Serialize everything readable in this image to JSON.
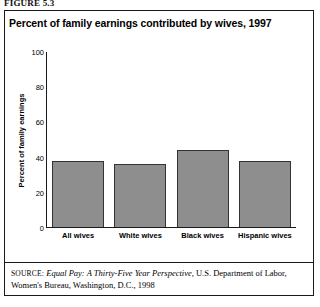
{
  "figure": {
    "label": "FIGURE 5.3",
    "title": "Percent of family earnings contributed by wives, 1997"
  },
  "source": {
    "prefix": "SOURCE:",
    "publication": "Equal Pay: A Thirty-Five Year Perspective,",
    "rest": "U.S. Department of Labor, Women's Bureau, Washington, D.C., 1998"
  },
  "colors": {
    "bar_fill": "#8e8e8e",
    "bar_border": "#333333",
    "axis": "#1a1a1a",
    "text": "#000000"
  },
  "chart_data": {
    "type": "bar",
    "title": "Percent of family earnings contributed by wives, 1997",
    "xlabel": "",
    "ylabel": "Percent of family earnings",
    "categories": [
      "All wives",
      "White wives",
      "Black wives",
      "Hispanic wives"
    ],
    "values": [
      38,
      36,
      44,
      38
    ],
    "ylim": [
      0,
      100
    ],
    "yticks": [
      0,
      20,
      40,
      60,
      80,
      100
    ],
    "grid": false,
    "legend": false
  }
}
